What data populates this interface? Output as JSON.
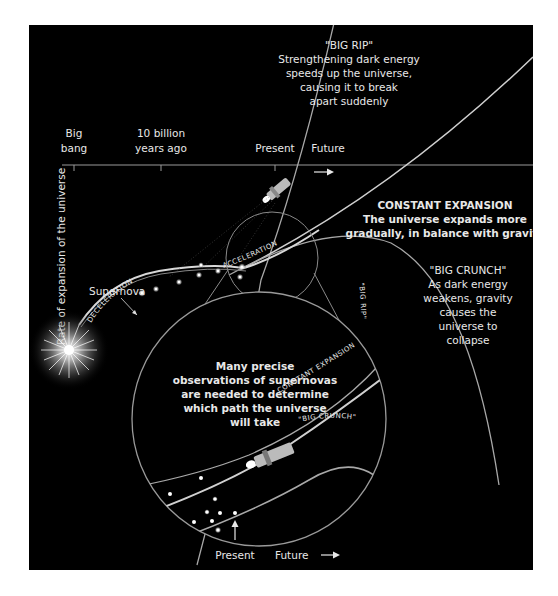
{
  "axis": {
    "y_label": "Rate of expansion of the universe",
    "ticks": [
      {
        "line1": "Big",
        "line2": "bang"
      },
      {
        "line1": "10 billion",
        "line2": "years ago"
      },
      {
        "line1": "Present",
        "line2": ""
      },
      {
        "line1": "Future",
        "line2": ""
      }
    ]
  },
  "scenarios": {
    "big_rip": {
      "title": "\"BIG RIP\"",
      "lines": [
        "Strengthening dark energy",
        "speeds up the universe,",
        "causing it to break",
        "apart suddenly"
      ]
    },
    "constant": {
      "title": "CONSTANT EXPANSION",
      "lines": [
        "The universe expands more",
        "gradually, in balance with gravity"
      ]
    },
    "big_crunch": {
      "title": "\"BIG CRUNCH\"",
      "lines": [
        "As dark energy",
        "weakens, gravity",
        "causes the",
        "universe to",
        "collapse"
      ]
    }
  },
  "curve_labels": {
    "supernova": "Supernova",
    "deceleration": "DECELERATION",
    "acceleration": "ACCELERATION"
  },
  "inset": {
    "caption": [
      "Many precise",
      "observations of supernovas",
      "are needed to determine",
      "which path the universe",
      "will take"
    ],
    "path_labels": {
      "big_rip": "\"BIG RIP\"",
      "constant": "CONSTANT EXPANSION",
      "big_crunch": "\"BIG CRUNCH\""
    },
    "present": "Present",
    "future": "Future"
  },
  "colors": {
    "background": "#000000",
    "line": "#bdbdbd",
    "text": "#e8e8e8"
  }
}
